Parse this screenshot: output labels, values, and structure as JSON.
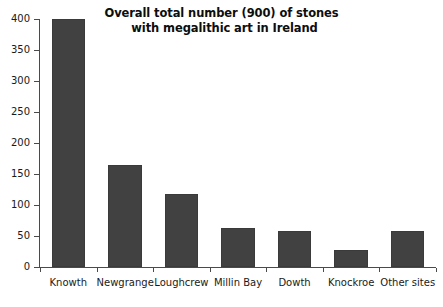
{
  "chart_data": {
    "type": "bar",
    "title": "Overall total number (900) of stones with megalithic art in Ireland",
    "title_lines": [
      "Overall total number (900) of stones",
      "with megalithic art in Ireland"
    ],
    "xlabel": "",
    "ylabel": "",
    "categories": [
      "Knowth",
      "Newgrange",
      "Loughcrew",
      "Millin Bay",
      "Dowth",
      "Knockroe",
      "Other sites"
    ],
    "values": [
      400,
      165,
      118,
      63,
      58,
      28,
      58
    ],
    "ylim": [
      0,
      400
    ],
    "ytick_values": [
      0,
      50,
      100,
      150,
      200,
      250,
      300,
      350,
      400
    ],
    "ytick_labels": [
      "0",
      "50",
      "100",
      "150",
      "200",
      "250",
      "300",
      "350",
      "400"
    ],
    "grid": false,
    "legend": false,
    "bar_color": "#414141",
    "axis_color": "#4a4a4a",
    "background_color": "#ffffff",
    "text_color": "#1a1a1a"
  }
}
